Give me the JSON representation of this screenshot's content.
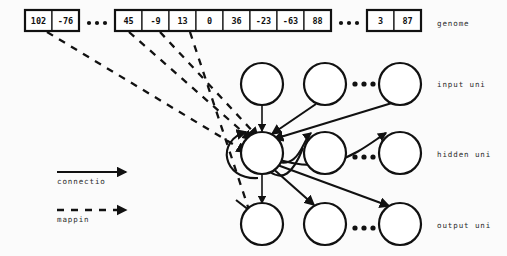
{
  "figure": {
    "background_color": "#fbfbfb",
    "ink_color": "#111111"
  },
  "genome": {
    "label": "genome",
    "groups": [
      {
        "name": "left-fragment",
        "values": [
          "102",
          "-76"
        ]
      },
      {
        "name": "middle-fragment",
        "values": [
          "45",
          "-9",
          "13",
          "0",
          "36",
          "-23",
          "-63",
          "88"
        ]
      },
      {
        "name": "right-fragment",
        "values": [
          "3",
          "87"
        ]
      }
    ],
    "ellipsis": "..."
  },
  "layers": [
    {
      "name": "input",
      "label": "input uni",
      "unit_count_shown": 3,
      "ellipsis": "..."
    },
    {
      "name": "hidden",
      "label": "hidden uni",
      "unit_count_shown": 3,
      "ellipsis": "..."
    },
    {
      "name": "output",
      "label": "output uni",
      "unit_count_shown": 3,
      "ellipsis": "..."
    }
  ],
  "legend": {
    "items": [
      {
        "name": "connection",
        "label": "connectio",
        "style": "solid-arrow"
      },
      {
        "name": "mapping",
        "label": "mappin",
        "style": "dashed-arrow"
      }
    ]
  }
}
